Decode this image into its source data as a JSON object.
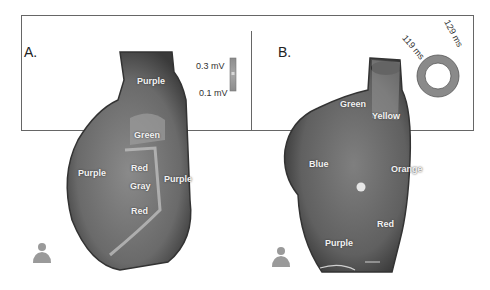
{
  "panels": [
    {
      "id": "A",
      "label": "A.",
      "regions": [
        "Purple",
        "Green",
        "Red",
        "Gray",
        "Red",
        "Purple",
        "Purple"
      ],
      "scale_bar": {
        "max_label": "0.3 mV",
        "min_label": "0.1 mV"
      }
    },
    {
      "id": "B",
      "label": "B.",
      "regions": [
        "Green",
        "Yellow",
        "Blue",
        "Orange",
        "Red",
        "Purple"
      ],
      "timing_ring": {
        "label_outer": "129 ms",
        "label_inner": "119 ms"
      }
    }
  ],
  "labels": {
    "a_purple_top": "Purple",
    "a_green": "Green",
    "a_red_top": "Red",
    "a_gray": "Gray",
    "a_red_bottom": "Red",
    "a_purple_left": "Purple",
    "a_purple_right": "Purple",
    "b_green": "Green",
    "b_yellow": "Yellow",
    "b_blue": "Blue",
    "b_orange": "Orange",
    "b_red": "Red",
    "b_purple": "Purple"
  },
  "icons": [
    "torso-orientation-icon",
    "torso-orientation-icon"
  ]
}
